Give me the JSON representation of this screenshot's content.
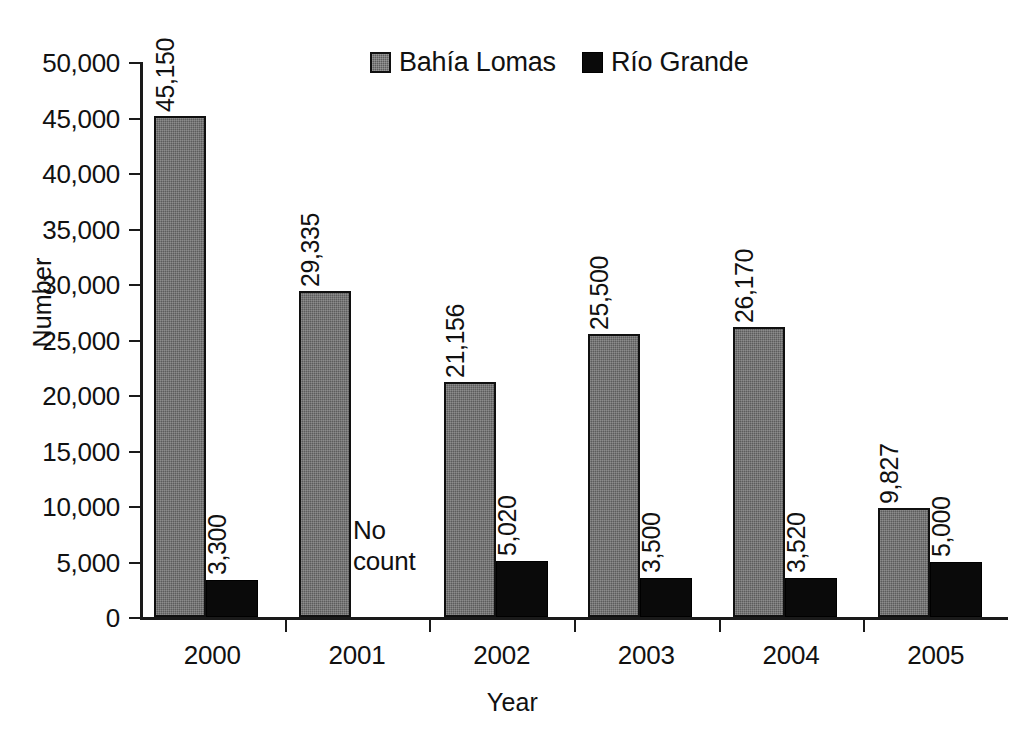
{
  "chart_data": {
    "type": "bar",
    "title": "",
    "xlabel": "Year",
    "ylabel": "Number",
    "categories": [
      "2000",
      "2001",
      "2002",
      "2003",
      "2004",
      "2005"
    ],
    "series": [
      {
        "name": "Bahía Lomas",
        "color": "#5c5c5c",
        "values": [
          45150,
          29335,
          21156,
          25500,
          26170,
          9827
        ],
        "labels": [
          "45,150",
          "29,335",
          "21,156",
          "25,500",
          "26,170",
          "9,827"
        ]
      },
      {
        "name": "Río Grande",
        "color": "#0a0a0a",
        "values": [
          3300,
          null,
          5020,
          3500,
          3520,
          5000
        ],
        "labels": [
          "3,300",
          "",
          "5,020",
          "3,500",
          "3,520",
          "5,000"
        ]
      }
    ],
    "ylim": [
      0,
      50000
    ],
    "ytick_values": [
      0,
      5000,
      10000,
      15000,
      20000,
      25000,
      30000,
      35000,
      40000,
      45000,
      50000
    ],
    "ytick_labels": [
      "0",
      "5,000",
      "10,000",
      "15,000",
      "20,000",
      "25,000",
      "30,000",
      "35,000",
      "40,000",
      "45,000",
      "50,000"
    ],
    "grid": false,
    "legend_position": "top-center",
    "annotations": [
      {
        "text": "No\ncount",
        "category": "2001",
        "series": "Río Grande"
      }
    ]
  },
  "legend": {
    "items": [
      {
        "label": "Bahía  Lomas",
        "icon": "gray-square-swatch"
      },
      {
        "label": "Río Grande",
        "icon": "black-square-swatch"
      }
    ]
  },
  "axes": {
    "y_title": "Number",
    "x_title": "Year"
  }
}
